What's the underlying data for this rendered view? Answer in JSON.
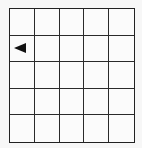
{
  "board": {
    "rows": 5,
    "cols": 5,
    "agent": {
      "row": 1,
      "col": 0,
      "direction": "left",
      "icon": "left-arrow-triangle-icon"
    },
    "colors": {
      "grid_line": "#2a2a2a",
      "cell_fill": "#fbfbfb",
      "agent": "#111111"
    }
  }
}
